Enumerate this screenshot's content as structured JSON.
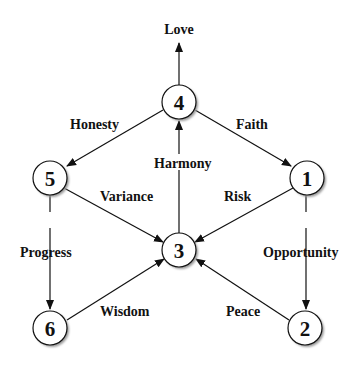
{
  "diagram": {
    "type": "directed-graph",
    "nodes": [
      {
        "id": "4",
        "label": "4",
        "x": 179,
        "y": 102
      },
      {
        "id": "5",
        "label": "5",
        "x": 50,
        "y": 178
      },
      {
        "id": "1",
        "label": "1",
        "x": 307,
        "y": 178
      },
      {
        "id": "3",
        "label": "3",
        "x": 179,
        "y": 250
      },
      {
        "id": "6",
        "label": "6",
        "x": 50,
        "y": 328
      },
      {
        "id": "2",
        "label": "2",
        "x": 305,
        "y": 328
      }
    ],
    "edges": [
      {
        "from": "4",
        "to": "out",
        "label": "Love"
      },
      {
        "from": "4",
        "to": "5",
        "label": "Honesty"
      },
      {
        "from": "4",
        "to": "1",
        "label": "Faith"
      },
      {
        "from": "3",
        "to": "4",
        "label": "Harmony"
      },
      {
        "from": "5",
        "to": "3",
        "label": "Variance"
      },
      {
        "from": "1",
        "to": "3",
        "label": "Risk"
      },
      {
        "from": "5",
        "to": "6",
        "label": "Progress"
      },
      {
        "from": "1",
        "to": "2",
        "label": "Opportunity"
      },
      {
        "from": "6",
        "to": "3",
        "label": "Wisdom"
      },
      {
        "from": "2",
        "to": "3",
        "label": "Peace"
      }
    ]
  },
  "labels": {
    "love": "Love",
    "honesty": "Honesty",
    "faith": "Faith",
    "harmony": "Harmony",
    "variance": "Variance",
    "risk": "Risk",
    "progress": "Progress",
    "opportunity": "Opportunity",
    "wisdom": "Wisdom",
    "peace": "Peace"
  },
  "nodes": {
    "n1": "1",
    "n2": "2",
    "n3": "3",
    "n4": "4",
    "n5": "5",
    "n6": "6"
  },
  "colors": {
    "stroke": "#111111",
    "node_fill": "#ffffff",
    "shadow": "#9a9a9a"
  }
}
